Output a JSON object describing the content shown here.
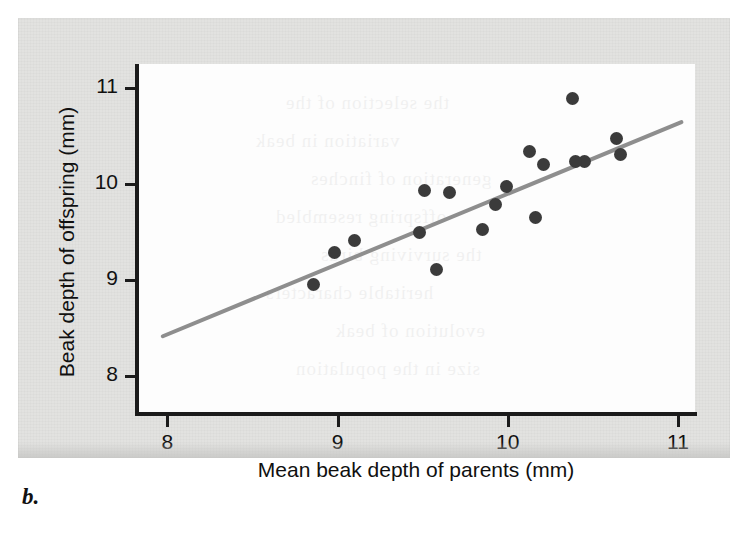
{
  "caption": "b.",
  "colors": {
    "paper": "#e2e2e0",
    "canvas": "#fdfdfd",
    "axis": "#1b1b1b",
    "point": "#3b3b3b",
    "trendline": "#8e8e8e",
    "text": "#111111"
  },
  "chart_data": {
    "type": "scatter",
    "title": "",
    "xlabel": "Mean beak depth of parents (mm)",
    "ylabel": "Beak depth of offspring (mm)",
    "xlim": [
      7.81,
      11.1
    ],
    "ylim": [
      7.6,
      11.25
    ],
    "xticks": [
      8,
      9,
      10,
      11
    ],
    "xticklabels": [
      "8",
      "9",
      "10",
      "11"
    ],
    "yticks": [
      8,
      9,
      10,
      11
    ],
    "yticklabels": [
      "8",
      "9",
      "10",
      "11"
    ],
    "grid": false,
    "legend": null,
    "points": [
      {
        "x": 8.86,
        "y": 8.95
      },
      {
        "x": 8.98,
        "y": 9.28
      },
      {
        "x": 9.1,
        "y": 9.41
      },
      {
        "x": 9.48,
        "y": 9.49
      },
      {
        "x": 9.51,
        "y": 9.93
      },
      {
        "x": 9.58,
        "y": 9.11
      },
      {
        "x": 9.66,
        "y": 9.91
      },
      {
        "x": 9.85,
        "y": 9.52
      },
      {
        "x": 9.93,
        "y": 9.79
      },
      {
        "x": 9.99,
        "y": 9.97
      },
      {
        "x": 10.13,
        "y": 10.34
      },
      {
        "x": 10.16,
        "y": 9.65
      },
      {
        "x": 10.21,
        "y": 10.2
      },
      {
        "x": 10.38,
        "y": 10.89
      },
      {
        "x": 10.45,
        "y": 10.23
      },
      {
        "x": 10.64,
        "y": 10.47
      },
      {
        "x": 10.66,
        "y": 10.31
      },
      {
        "x": 10.4,
        "y": 10.23
      }
    ],
    "trendline": {
      "x0": 7.96,
      "y0": 8.4,
      "x1": 11.03,
      "y1": 10.65,
      "style": "solid",
      "color": "#8e8e8e"
    }
  },
  "bleed_text": [
    {
      "left": 150,
      "top": 28,
      "text": "the selection of the"
    },
    {
      "left": 120,
      "top": 66,
      "text": "variation in beak"
    },
    {
      "left": 175,
      "top": 104,
      "text": "generation of finches"
    },
    {
      "left": 140,
      "top": 142,
      "text": "offspring resembled"
    },
    {
      "left": 185,
      "top": 180,
      "text": "the surviving birds"
    },
    {
      "left": 130,
      "top": 218,
      "text": "heritable characters"
    },
    {
      "left": 200,
      "top": 256,
      "text": "evolution of beak"
    },
    {
      "left": 160,
      "top": 294,
      "text": "size in the population"
    }
  ]
}
